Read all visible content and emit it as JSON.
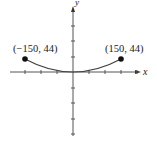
{
  "figure": {
    "type": "parabola-graph",
    "axes": {
      "x_label": "x",
      "y_label": "y",
      "x_tick_spacing_units": 50,
      "ticks_x_count_each_side": 4,
      "ticks_y_count_each_side": 4
    },
    "curve": {
      "equation": "y = a x^2",
      "vertex": [
        0,
        0
      ],
      "endpoints": [
        [
          -150,
          44
        ],
        [
          150,
          44
        ]
      ]
    },
    "points": [
      {
        "label": "(−150, 44)",
        "x": -150,
        "y": 44
      },
      {
        "label": "(150, 44)",
        "x": 150,
        "y": 44
      }
    ],
    "colors": {
      "ink": "#222222",
      "axis": "#555555",
      "curve": "#444444"
    }
  }
}
